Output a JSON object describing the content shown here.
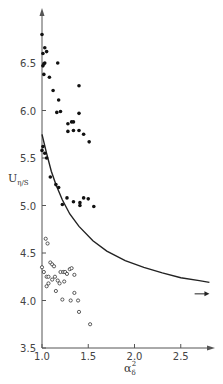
{
  "chart_data": {
    "type": "scatter",
    "title": "",
    "xlabel": "α_δ²",
    "ylabel": "U_η/S",
    "xlim": [
      1.0,
      2.8
    ],
    "ylim": [
      3.5,
      6.9
    ],
    "xticks": [
      1.0,
      1.5,
      2.0,
      2.5
    ],
    "xtick_labels": [
      "1.0",
      "1.5",
      "2.0",
      "2.5"
    ],
    "yticks": [
      3.5,
      4.0,
      4.5,
      5.0,
      5.5,
      6.0,
      6.5
    ],
    "ytick_labels": [
      "3.5",
      "4.0",
      "4.5",
      "5.0",
      "5.5",
      "6.0",
      "6.5"
    ],
    "grid": false,
    "legend": null,
    "series": [
      {
        "name": "filled points",
        "marker": "filled-circle",
        "points": [
          [
            1.0,
            6.8
          ],
          [
            1.03,
            6.66
          ],
          [
            1.01,
            6.6
          ],
          [
            1.05,
            6.62
          ],
          [
            1.03,
            6.5
          ],
          [
            1.01,
            6.47
          ],
          [
            1.02,
            6.49
          ],
          [
            1.17,
            6.5
          ],
          [
            1.02,
            6.38
          ],
          [
            1.08,
            6.35
          ],
          [
            1.12,
            6.21
          ],
          [
            1.4,
            6.26
          ],
          [
            1.18,
            6.11
          ],
          [
            1.2,
            5.99
          ],
          [
            1.16,
            5.98
          ],
          [
            1.4,
            5.97
          ],
          [
            1.28,
            5.86
          ],
          [
            1.32,
            5.88
          ],
          [
            1.34,
            5.88
          ],
          [
            1.28,
            5.78
          ],
          [
            1.34,
            5.79
          ],
          [
            1.4,
            5.79
          ],
          [
            1.45,
            5.75
          ],
          [
            1.51,
            5.67
          ],
          [
            1.01,
            5.62
          ],
          [
            1.0,
            5.58
          ],
          [
            1.03,
            5.55
          ],
          [
            1.05,
            5.5
          ],
          [
            1.09,
            5.3
          ],
          [
            1.15,
            5.22
          ],
          [
            1.18,
            5.19
          ],
          [
            1.27,
            5.08
          ],
          [
            1.34,
            5.04
          ],
          [
            1.41,
            5.03
          ],
          [
            1.45,
            5.08
          ],
          [
            1.5,
            5.07
          ],
          [
            1.41,
            5.0
          ],
          [
            1.56,
            4.99
          ],
          [
            1.22,
            5.01
          ]
        ]
      },
      {
        "name": "open points",
        "marker": "open-circle",
        "points": [
          [
            1.04,
            4.65
          ],
          [
            1.06,
            4.6
          ],
          [
            1.0,
            4.35
          ],
          [
            1.02,
            4.3
          ],
          [
            1.05,
            4.25
          ],
          [
            1.07,
            4.18
          ],
          [
            1.09,
            4.4
          ],
          [
            1.11,
            4.38
          ],
          [
            1.13,
            4.36
          ],
          [
            1.07,
            4.25
          ],
          [
            1.11,
            4.22
          ],
          [
            1.14,
            4.25
          ],
          [
            1.17,
            4.21
          ],
          [
            1.19,
            4.18
          ],
          [
            1.2,
            4.3
          ],
          [
            1.23,
            4.3
          ],
          [
            1.25,
            4.3
          ],
          [
            1.27,
            4.28
          ],
          [
            1.3,
            4.33
          ],
          [
            1.32,
            4.34
          ],
          [
            1.35,
            4.27
          ],
          [
            1.15,
            4.1
          ],
          [
            1.22,
            4.01
          ],
          [
            1.31,
            4.0
          ],
          [
            1.35,
            4.08
          ],
          [
            1.39,
            4.0
          ],
          [
            1.4,
            3.88
          ],
          [
            1.52,
            3.75
          ],
          [
            1.24,
            4.2
          ],
          [
            1.05,
            4.15
          ]
        ]
      }
    ],
    "curve": {
      "name": "fitted curve",
      "points": [
        [
          1.0,
          5.75
        ],
        [
          1.05,
          5.55
        ],
        [
          1.1,
          5.36
        ],
        [
          1.15,
          5.22
        ],
        [
          1.22,
          5.06
        ],
        [
          1.3,
          4.91
        ],
        [
          1.4,
          4.78
        ],
        [
          1.55,
          4.63
        ],
        [
          1.7,
          4.52
        ],
        [
          1.9,
          4.42
        ],
        [
          2.1,
          4.35
        ],
        [
          2.3,
          4.29
        ],
        [
          2.5,
          4.24
        ],
        [
          2.7,
          4.21
        ],
        [
          2.81,
          4.19
        ]
      ]
    },
    "annotations": [
      {
        "type": "arrow",
        "direction": "right",
        "x": [
          2.65,
          2.81
        ],
        "y": 4.07
      }
    ]
  }
}
